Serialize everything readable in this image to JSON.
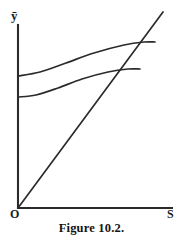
{
  "figure": {
    "caption": "Figure 10.2.",
    "background_color": "#ffffff",
    "ink_color": "#2b2b2b"
  },
  "axes": {
    "y_axis_label": "ȳ",
    "x_axis_label": "S",
    "origin_label": "O",
    "y_axis": {
      "x": 18,
      "y_top": 25,
      "y_bottom": 208
    },
    "x_axis": {
      "y": 208,
      "x_left": 18,
      "x_right": 172
    }
  },
  "chart_data": {
    "type": "line",
    "title": "Figure 10.2.",
    "xlabel": "S",
    "ylabel": "ȳ",
    "grid": false,
    "legend": "none",
    "axis_origin_label": "O",
    "xlim": [
      0,
      172
    ],
    "ylim": [
      0,
      208
    ],
    "series": [
      {
        "name": "45-degree ray",
        "kind": "straight-ray-from-origin",
        "points": [
          [
            18,
            208
          ],
          [
            163,
            12
          ]
        ]
      },
      {
        "name": "upper effort curve",
        "kind": "concave-rising-curve",
        "y_intercept": 76,
        "points": [
          [
            18,
            76
          ],
          [
            40,
            72
          ],
          [
            66,
            63
          ],
          [
            94,
            53
          ],
          [
            124,
            45
          ],
          [
            144,
            42
          ],
          [
            155,
            42
          ]
        ]
      },
      {
        "name": "lower effort curve",
        "kind": "concave-rising-curve",
        "y_intercept": 97,
        "points": [
          [
            18,
            97
          ],
          [
            36,
            95
          ],
          [
            58,
            88
          ],
          [
            82,
            79
          ],
          [
            108,
            72
          ],
          [
            128,
            69
          ],
          [
            140,
            69
          ]
        ]
      }
    ],
    "intersections": [
      {
        "label": "upper curve x ray",
        "point": [
          132,
          44
        ]
      },
      {
        "label": "lower curve x ray",
        "point": [
          107,
          72
        ]
      }
    ]
  }
}
